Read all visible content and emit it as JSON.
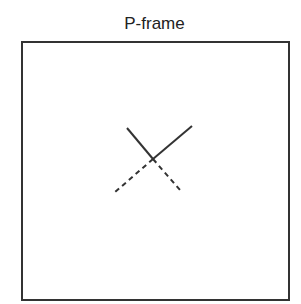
{
  "title": "P-frame",
  "diagram": {
    "frame": {
      "x": 22,
      "y": 42,
      "width": 265,
      "height": 256,
      "stroke": "#333333"
    },
    "lines": [
      {
        "style": "solid",
        "x1": 127,
        "y1": 128,
        "x2": 153,
        "y2": 159
      },
      {
        "style": "solid",
        "x1": 192,
        "y1": 126,
        "x2": 153,
        "y2": 159
      },
      {
        "style": "dashed",
        "x1": 153,
        "y1": 159,
        "x2": 114,
        "y2": 193
      },
      {
        "style": "dashed",
        "x1": 153,
        "y1": 159,
        "x2": 180,
        "y2": 190
      }
    ],
    "line_color": "#333333"
  }
}
